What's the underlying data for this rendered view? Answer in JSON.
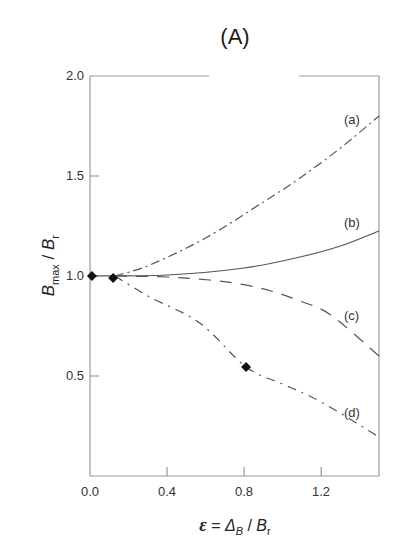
{
  "chart_data": {
    "type": "line",
    "title": "(A)",
    "xlabel": "ε = Δ_B / B_r",
    "ylabel": "B_max / B_r",
    "xlim": [
      0.0,
      1.5
    ],
    "ylim": [
      0.0,
      2.0
    ],
    "x_ticks": [
      "0.0",
      "0.4",
      "0.8",
      "1.2"
    ],
    "y_ticks": [
      "0.5",
      "1.0",
      "1.5",
      "2.0"
    ],
    "grid": false,
    "legend_position": "inline labels at right end of curves",
    "series": [
      {
        "name": "(a)",
        "style": "dash-dot",
        "x": [
          0.13,
          0.31,
          0.6,
          0.9,
          1.09,
          1.3,
          1.5
        ],
        "y": [
          1.0,
          1.055,
          1.19,
          1.37,
          1.49,
          1.64,
          1.8
        ]
      },
      {
        "name": "(b)",
        "style": "solid",
        "x": [
          0.0,
          0.4,
          0.8,
          1.09,
          1.3,
          1.5
        ],
        "y": [
          1.0,
          1.005,
          1.04,
          1.095,
          1.15,
          1.225
        ]
      },
      {
        "name": "(c)",
        "style": "dashed",
        "x": [
          0.13,
          0.4,
          0.62,
          0.78,
          0.94,
          1.09,
          1.25,
          1.5
        ],
        "y": [
          1.0,
          0.995,
          0.98,
          0.96,
          0.925,
          0.875,
          0.805,
          0.6
        ]
      },
      {
        "name": "(d)",
        "style": "dash-dot-dot",
        "x": [
          0.13,
          0.31,
          0.57,
          0.81,
          1.0,
          1.2,
          1.5
        ],
        "y": [
          1.0,
          0.895,
          0.765,
          0.545,
          0.46,
          0.37,
          0.195
        ]
      }
    ],
    "markers": {
      "shape": "diamond",
      "points": [
        {
          "x": 0.01,
          "y": 1.0
        },
        {
          "x": 0.12,
          "y": 0.99
        },
        {
          "x": 0.81,
          "y": 0.545
        }
      ]
    }
  },
  "labels": {
    "title": "(A)",
    "y_ticks": [
      {
        "label": "2.0",
        "value": 2.0
      },
      {
        "label": "1.5",
        "value": 1.5
      },
      {
        "label": "1.0",
        "value": 1.0
      },
      {
        "label": "0.5",
        "value": 0.5
      }
    ],
    "x_ticks": [
      {
        "label": "0.0",
        "value": 0.0
      },
      {
        "label": "0.4",
        "value": 0.4
      },
      {
        "label": "0.8",
        "value": 0.8
      },
      {
        "label": "1.2",
        "value": 1.2
      }
    ],
    "series_labels": [
      "(a)",
      "(b)",
      "(c)",
      "(d)"
    ],
    "xlabel_eps": "ε",
    "xlabel_eq": "=",
    "xlabel_delta": "Δ",
    "xlabel_delta_sub": "B",
    "xlabel_slash": "/",
    "xlabel_b": "B",
    "xlabel_b_sub": "r",
    "ylabel_b": "B",
    "ylabel_b_sub": "max",
    "ylabel_slash": " / ",
    "ylabel_br": "B",
    "ylabel_br_sub": "r"
  },
  "colors": {
    "axis": "#9a9a9a",
    "curve": "#555555",
    "marker": "#111111",
    "text": "#333333"
  }
}
